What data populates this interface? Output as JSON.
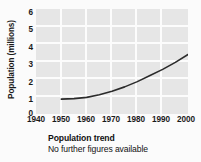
{
  "chart_data": {
    "type": "line",
    "title": "Population trend",
    "subtitle": "No further figures available",
    "xlabel": "",
    "ylabel": "Population (millions)",
    "xlim": [
      1940,
      2000
    ],
    "ylim": [
      0,
      6
    ],
    "xticks": [
      1940,
      1950,
      1960,
      1970,
      1980,
      1990,
      2000
    ],
    "yticks": [
      0,
      1,
      2,
      3,
      4,
      5,
      6
    ],
    "grid": true,
    "legend": "none",
    "series": [
      {
        "name": "Population",
        "x": [
          1950,
          1955,
          1960,
          1965,
          1970,
          1975,
          1980,
          1985,
          1990,
          1995,
          2000
        ],
        "values": [
          0.85,
          0.88,
          0.95,
          1.1,
          1.3,
          1.55,
          1.85,
          2.2,
          2.55,
          2.95,
          3.4
        ]
      }
    ],
    "annotations": []
  },
  "axes": {
    "ylabel": "Population (millions)",
    "ytick_labels": [
      "6",
      "5",
      "4",
      "3",
      "2",
      "1",
      "0"
    ],
    "xtick_labels": [
      "1940",
      "1950",
      "1960",
      "1970",
      "1980",
      "1990",
      "2000"
    ]
  },
  "caption": {
    "title": "Population trend",
    "subtitle": "No further figures available"
  },
  "colors": {
    "plot_background": "#e6e6e6",
    "figure_background": "#fbfbfb",
    "gridline": "#fcfcfc",
    "curve": "#2b2b2b",
    "text": "#1a1a1a"
  }
}
